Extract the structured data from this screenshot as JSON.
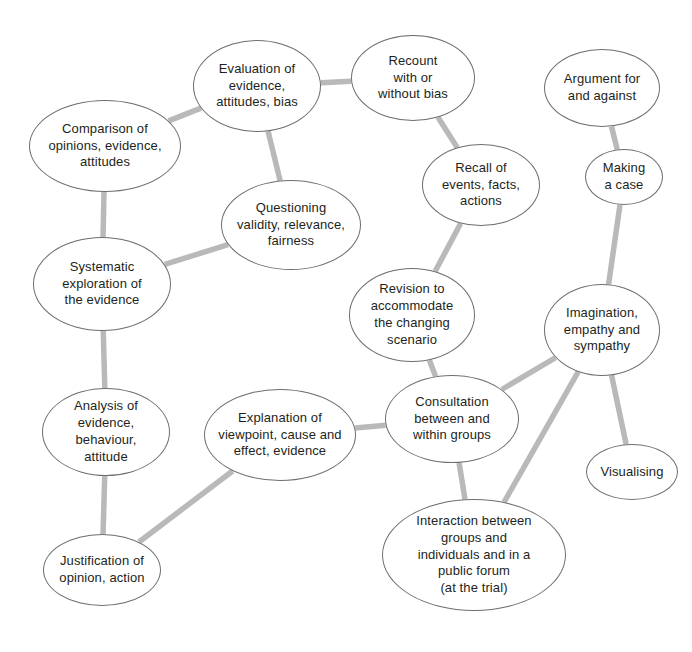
{
  "diagram": {
    "background_color": "#ffffff",
    "node_fill": "#ffffff",
    "node_stroke": "#6e6e6e",
    "edge_color": "#b9b9b9",
    "text_color": "#231f20",
    "nodes": [
      {
        "id": "evaluation",
        "label": "Evaluation of\nevidence,\nattitudes, bias",
        "cx": 257,
        "cy": 86,
        "rx": 64,
        "ry": 46,
        "font_size": 13
      },
      {
        "id": "comparison",
        "label": "Comparison of\nopinions, evidence,\nattitudes",
        "cx": 105,
        "cy": 146,
        "rx": 76,
        "ry": 46,
        "font_size": 13
      },
      {
        "id": "recount",
        "label": "Recount\nwith or\nwithout bias",
        "cx": 413,
        "cy": 78,
        "rx": 62,
        "ry": 43,
        "font_size": 13
      },
      {
        "id": "argument",
        "label": "Argument for\nand against",
        "cx": 602,
        "cy": 88,
        "rx": 58,
        "ry": 39,
        "font_size": 13
      },
      {
        "id": "recall",
        "label": "Recall of\nevents, facts,\nactions",
        "cx": 481,
        "cy": 185,
        "rx": 59,
        "ry": 41,
        "font_size": 13
      },
      {
        "id": "making-a-case",
        "label": "Making\na case",
        "cx": 624,
        "cy": 177,
        "rx": 39,
        "ry": 28,
        "font_size": 13
      },
      {
        "id": "questioning",
        "label": "Questioning\nvalidity, relevance,\nfairness",
        "cx": 291,
        "cy": 225,
        "rx": 70,
        "ry": 45,
        "font_size": 13
      },
      {
        "id": "systematic",
        "label": "Systematic\nexploration of\nthe evidence",
        "cx": 102,
        "cy": 284,
        "rx": 69,
        "ry": 47,
        "font_size": 13
      },
      {
        "id": "revision",
        "label": "Revision to\naccommodate\nthe changing\nscenario",
        "cx": 412,
        "cy": 315,
        "rx": 63,
        "ry": 47,
        "font_size": 13
      },
      {
        "id": "imagination",
        "label": "Imagination,\nempathy and\nsympathy",
        "cx": 602,
        "cy": 330,
        "rx": 58,
        "ry": 46,
        "font_size": 13
      },
      {
        "id": "analysis",
        "label": "Analysis of\nevidence,\nbehaviour,\nattitude",
        "cx": 106,
        "cy": 432,
        "rx": 64,
        "ry": 44,
        "font_size": 13
      },
      {
        "id": "explanation",
        "label": "Explanation of\nviewpoint, cause and\neffect, evidence",
        "cx": 280,
        "cy": 435,
        "rx": 76,
        "ry": 46,
        "font_size": 13
      },
      {
        "id": "consultation",
        "label": "Consultation\nbetween and\nwithin groups",
        "cx": 452,
        "cy": 419,
        "rx": 67,
        "ry": 44,
        "font_size": 13
      },
      {
        "id": "visualising",
        "label": "Visualising",
        "cx": 632,
        "cy": 472,
        "rx": 46,
        "ry": 28,
        "font_size": 13
      },
      {
        "id": "justification",
        "label": "Justification of\nopinion, action",
        "cx": 102,
        "cy": 570,
        "rx": 59,
        "ry": 36,
        "font_size": 13
      },
      {
        "id": "interaction",
        "label": "Interaction between\ngroups and\nindividuals and in a\npublic forum\n(at the trial)",
        "cx": 474,
        "cy": 555,
        "rx": 92,
        "ry": 56,
        "font_size": 13
      }
    ],
    "edges": [
      {
        "from": "comparison",
        "to": "evaluation"
      },
      {
        "from": "evaluation",
        "to": "recount"
      },
      {
        "from": "evaluation",
        "to": "questioning"
      },
      {
        "from": "comparison",
        "to": "systematic"
      },
      {
        "from": "systematic",
        "to": "questioning"
      },
      {
        "from": "recount",
        "to": "recall"
      },
      {
        "from": "recall",
        "to": "revision"
      },
      {
        "from": "argument",
        "to": "making-a-case"
      },
      {
        "from": "making-a-case",
        "to": "imagination"
      },
      {
        "from": "systematic",
        "to": "analysis"
      },
      {
        "from": "analysis",
        "to": "justification"
      },
      {
        "from": "justification",
        "to": "explanation"
      },
      {
        "from": "explanation",
        "to": "consultation"
      },
      {
        "from": "revision",
        "to": "consultation"
      },
      {
        "from": "consultation",
        "to": "imagination"
      },
      {
        "from": "consultation",
        "to": "interaction"
      },
      {
        "from": "imagination",
        "to": "interaction"
      },
      {
        "from": "imagination",
        "to": "visualising"
      }
    ]
  }
}
